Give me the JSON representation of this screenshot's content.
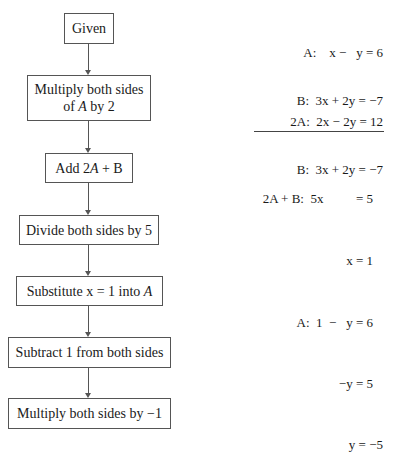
{
  "steps": [
    {
      "label_pre": "Given",
      "label_var": "",
      "label_post": ""
    },
    {
      "label_pre": "Multiply both sides of ",
      "label_var": "A",
      "label_post": " by 2"
    },
    {
      "label_pre": "Add 2",
      "label_var": "A",
      "label_post": " + B"
    },
    {
      "label_pre": "Divide both sides by 5",
      "label_var": "",
      "label_post": ""
    },
    {
      "label_pre": "Substitute x = 1 into ",
      "label_var": "A",
      "label_post": ""
    },
    {
      "label_pre": "Subtract 1 from both sides",
      "label_var": "",
      "label_post": ""
    },
    {
      "label_pre": "Multiply both sides by −1",
      "label_var": "",
      "label_post": ""
    }
  ],
  "equations": [
    {
      "lines": [
        "A:    x −   y = 6",
        "B:  3x + 2y = −7"
      ]
    },
    {
      "lines": [
        "2A:  2x − 2y = 12",
        "B:  3x + 2y = −7"
      ]
    },
    {
      "lines": [
        "2A + B:  5x          = 5"
      ]
    },
    {
      "lines": [
        "x = 1"
      ]
    },
    {
      "lines": [
        "A:  1  −   y = 6"
      ]
    },
    {
      "lines": [
        "−y = 5"
      ]
    },
    {
      "lines": [
        "y = −5"
      ]
    }
  ]
}
